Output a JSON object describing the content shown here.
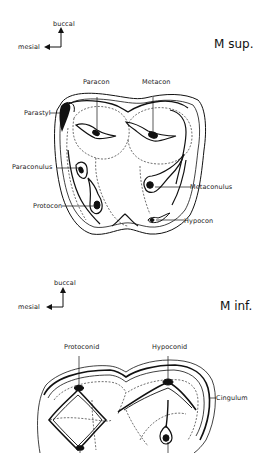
{
  "upper_molar": {
    "title": "M sup.",
    "orientation": {
      "vertical": "buccal",
      "horizontal": "mesial"
    },
    "labels": {
      "paracon": "Paracon",
      "metacon": "Metacon",
      "parastyl": "Parastyl",
      "paraconulus": "Paraconulus",
      "metaconulus": "Metaconulus",
      "protocon": "Protocon",
      "hypocon": "Hypocon"
    }
  },
  "lower_molar": {
    "title": "M inf.",
    "orientation": {
      "vertical": "buccal",
      "horizontal": "mesial"
    },
    "labels": {
      "protoconid": "Protoconid",
      "hypoconid": "Hypoconid",
      "cingulum": "Cingulum"
    }
  }
}
